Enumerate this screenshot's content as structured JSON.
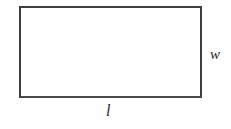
{
  "figure": {
    "type": "rectangle-diagram",
    "shape_name": "rectangle",
    "stroke_color": "#3f3f3f",
    "fill_color": "#ffffff",
    "background_color": "#ffffff",
    "labels": {
      "width": "w",
      "length": "l"
    }
  }
}
